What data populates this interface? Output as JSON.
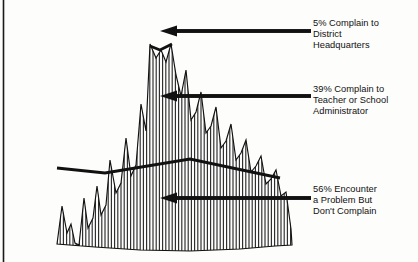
{
  "figure": {
    "title": "",
    "border_color": "#1a1a1a",
    "ink_color": "#111111",
    "hatch_color": "#2b2b2b",
    "background": "#fdfdfc"
  },
  "callouts": [
    {
      "id": "callout-0",
      "percent": "5%",
      "lines": [
        "5%  Complain to",
        "District",
        "Headquarters"
      ],
      "text": "5%  Complain to\nDistrict\nHeadquarters",
      "arrow_tip_x": 160,
      "arrow_tail_x": 311,
      "arrow_y": 31
    },
    {
      "id": "callout-1",
      "percent": "39%",
      "lines": [
        "39% Complain to",
        "Teacher or School",
        "Administrator"
      ],
      "text": "39% Complain to\nTeacher or School\nAdministrator",
      "arrow_tip_x": 160,
      "arrow_tail_x": 311,
      "arrow_y": 96
    },
    {
      "id": "callout-2",
      "percent": "56%",
      "lines": [
        "56% Encounter",
        "a Problem But",
        "Don't Complain"
      ],
      "text": "56% Encounter\na Problem But\nDon't Complain",
      "arrow_tip_x": 160,
      "arrow_tail_x": 311,
      "arrow_y": 198
    }
  ],
  "chart_data": {
    "type": "area",
    "title": "",
    "xlabel": "",
    "ylabel": "",
    "legend_position": "right",
    "grid": false,
    "categories": [
      "Encounter a Problem But Don't Complain",
      "Complain to Teacher or School Administrator",
      "Complain to District Headquarters"
    ],
    "values": [
      56,
      39,
      5
    ],
    "series": [
      {
        "name": "56% Encounter a Problem But Don't Complain",
        "value": 56
      },
      {
        "name": "39% Complain to Teacher or School Administrator",
        "value": 39
      },
      {
        "name": "5% Complain to District Headquarters",
        "value": 5
      }
    ],
    "annotations": [
      "5%  Complain to District Headquarters",
      "39% Complain to Teacher or School Administrator",
      "56% Encounter a Problem But Don't Complain"
    ],
    "silhouette": [
      [
        57,
        244
      ],
      [
        62,
        206
      ],
      [
        67,
        233
      ],
      [
        71,
        224
      ],
      [
        75,
        243
      ],
      [
        79,
        245
      ],
      [
        84,
        198
      ],
      [
        88,
        228
      ],
      [
        93,
        218
      ],
      [
        97,
        186
      ],
      [
        101,
        215
      ],
      [
        106,
        205
      ],
      [
        110,
        160
      ],
      [
        116,
        193
      ],
      [
        121,
        183
      ],
      [
        126,
        138
      ],
      [
        131,
        176
      ],
      [
        136,
        165
      ],
      [
        141,
        104
      ],
      [
        146,
        131
      ],
      [
        150,
        44
      ],
      [
        156,
        58
      ],
      [
        161,
        50
      ],
      [
        166,
        62
      ],
      [
        171,
        44
      ],
      [
        176,
        75
      ],
      [
        181,
        96
      ],
      [
        186,
        70
      ],
      [
        191,
        120
      ],
      [
        196,
        112
      ],
      [
        201,
        92
      ],
      [
        206,
        133
      ],
      [
        211,
        126
      ],
      [
        216,
        107
      ],
      [
        221,
        148
      ],
      [
        226,
        141
      ],
      [
        231,
        124
      ],
      [
        236,
        160
      ],
      [
        241,
        153
      ],
      [
        246,
        140
      ],
      [
        251,
        172
      ],
      [
        256,
        166
      ],
      [
        261,
        156
      ],
      [
        266,
        184
      ],
      [
        271,
        179
      ],
      [
        276,
        170
      ],
      [
        281,
        196
      ],
      [
        286,
        192
      ],
      [
        291,
        229
      ],
      [
        292,
        245
      ]
    ],
    "baseline": [
      [
        57,
        244
      ],
      [
        95,
        247
      ],
      [
        140,
        250
      ],
      [
        190,
        251
      ],
      [
        240,
        249
      ],
      [
        275,
        246
      ],
      [
        292,
        245
      ]
    ],
    "divider_mid": [
      [
        57,
        168
      ],
      [
        105,
        173
      ],
      [
        190,
        159
      ],
      [
        280,
        178
      ]
    ],
    "divider_top": [
      [
        150,
        46
      ],
      [
        160,
        50
      ],
      [
        172,
        44
      ]
    ],
    "hatch_spacing_px": 3.2
  }
}
